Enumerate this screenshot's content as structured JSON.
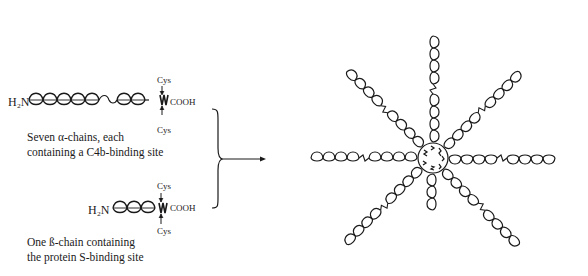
{
  "diagram": {
    "alpha_chain": {
      "n_terminus": "H₂N",
      "c_terminus": "COOH",
      "cys_top": "Cys",
      "cys_bottom": "Cys",
      "caption_line1": "Seven α-chains, each",
      "caption_line2": "containing a C4b-binding site",
      "domain_count": 8
    },
    "beta_chain": {
      "n_terminus": "H₂N",
      "c_terminus": "COOH",
      "cys_top": "Cys",
      "cys_bottom": "Cys",
      "caption_line1": "One ß-chain containing",
      "caption_line2": "the protein S-binding site",
      "domain_count": 3
    },
    "assembly": {
      "description": "Octopus-like spider structure: 7 long alpha-chain arms and 1 short beta-chain arm joined at a central core",
      "long_arms": 7,
      "short_arms": 1,
      "connector": "brace-with-arrow"
    },
    "colors": {
      "stroke": "#1a1a1a",
      "background": "#ffffff"
    }
  }
}
